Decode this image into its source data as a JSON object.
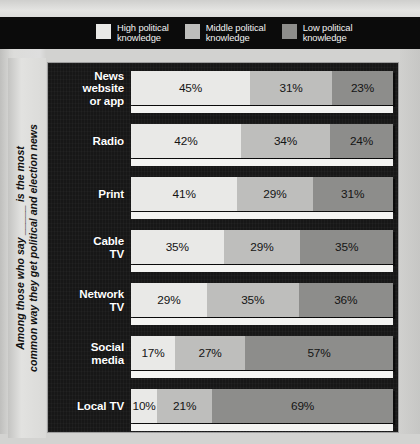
{
  "legend": {
    "items": [
      {
        "label": "High political\nknowledge",
        "color": "#e9e9e7",
        "icon": "legend-swatch-high"
      },
      {
        "label": "Middle political\nknowledge",
        "color": "#bebebc",
        "icon": "legend-swatch-middle"
      },
      {
        "label": "Low political\nknowledge",
        "color": "#8d8d8b",
        "icon": "legend-swatch-low"
      }
    ]
  },
  "caption": {
    "text": "Among those who say _____ is the most\ncommon way they get political and election news"
  },
  "chart_data": {
    "type": "bar",
    "orientation": "horizontal",
    "stacked": true,
    "normalized": true,
    "title": "",
    "subtitle": "",
    "xlabel": "",
    "ylabel": "",
    "xlim": [
      0,
      100
    ],
    "grid": false,
    "legend_position": "top",
    "value_suffix": "%",
    "categories": [
      "News\nwebsite\nor app",
      "Radio",
      "Print",
      "Cable\nTV",
      "Network\nTV",
      "Social\nmedia",
      "Local TV"
    ],
    "series": [
      {
        "name": "High political knowledge",
        "color": "#e9e9e7",
        "values": [
          45,
          42,
          41,
          35,
          29,
          17,
          10
        ]
      },
      {
        "name": "Middle political knowledge",
        "color": "#bebebc",
        "values": [
          31,
          34,
          29,
          29,
          35,
          27,
          21
        ]
      },
      {
        "name": "Low political knowledge",
        "color": "#8d8d8b",
        "values": [
          23,
          24,
          31,
          35,
          36,
          57,
          69
        ]
      }
    ],
    "rows": [
      {
        "category": "News\nwebsite\nor app",
        "high": "45%",
        "middle": "31%",
        "low": "23%",
        "hv": 45,
        "mv": 31,
        "lv": 23
      },
      {
        "category": "Radio",
        "high": "42%",
        "middle": "34%",
        "low": "24%",
        "hv": 42,
        "mv": 34,
        "lv": 24
      },
      {
        "category": "Print",
        "high": "41%",
        "middle": "29%",
        "low": "31%",
        "hv": 41,
        "mv": 29,
        "lv": 31
      },
      {
        "category": "Cable\nTV",
        "high": "35%",
        "middle": "29%",
        "low": "35%",
        "hv": 35,
        "mv": 29,
        "lv": 35
      },
      {
        "category": "Network\nTV",
        "high": "29%",
        "middle": "35%",
        "low": "36%",
        "hv": 29,
        "mv": 35,
        "lv": 36
      },
      {
        "category": "Social\nmedia",
        "high": "17%",
        "middle": "27%",
        "low": "57%",
        "hv": 17,
        "mv": 27,
        "lv": 57
      },
      {
        "category": "Local TV",
        "high": "10%",
        "middle": "21%",
        "low": "69%",
        "hv": 10,
        "mv": 21,
        "lv": 69
      }
    ]
  }
}
